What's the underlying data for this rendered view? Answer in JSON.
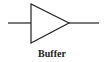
{
  "diagram": {
    "symbol": "buffer-gate",
    "label": "Buffer",
    "stroke_color": "#222222"
  }
}
